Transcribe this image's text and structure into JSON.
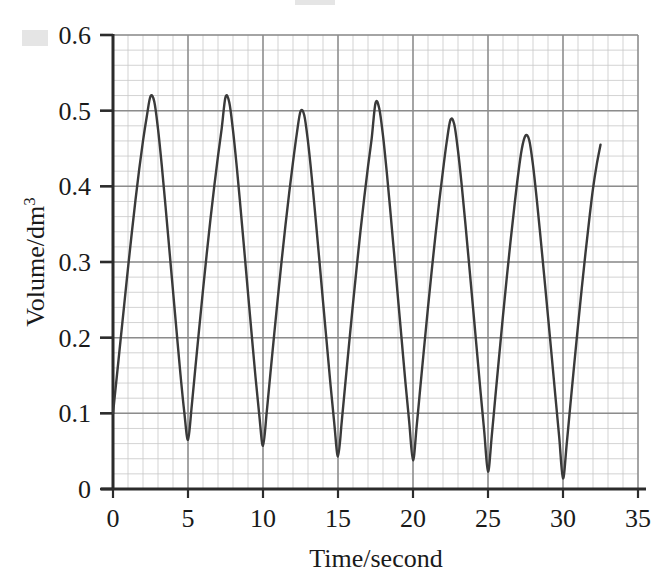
{
  "chart_data": {
    "type": "line",
    "title": "",
    "subtitle": "",
    "xlabel": "Time/second",
    "ylabel": "Volume/dm3",
    "ylabel_base": "Volume/dm",
    "ylabel_exponent": "3",
    "xlim": [
      0,
      35
    ],
    "ylim": [
      0,
      0.6
    ],
    "x_ticks": [
      0,
      5,
      10,
      15,
      20,
      25,
      30,
      35
    ],
    "x_tick_labels": [
      "0",
      "5",
      "10",
      "15",
      "20",
      "25",
      "30",
      "35"
    ],
    "y_ticks": [
      0,
      0.1,
      0.2,
      0.3,
      0.4,
      0.5,
      0.6
    ],
    "y_tick_labels": [
      "0",
      "0.1",
      "0.2",
      "0.3",
      "0.4",
      "0.5",
      "0.6"
    ],
    "x_minor_step": 1,
    "y_minor_step": 0.02,
    "grid": true,
    "grid_major_color": "#8c8c8c",
    "grid_minor_color": "#c8c8c8",
    "legend": null,
    "legend_position": "none",
    "series": [
      {
        "name": "Volume",
        "color": "#3a3a3a",
        "line_width": 2.4,
        "x": [
          0.0,
          0.25,
          0.5,
          0.75,
          1.0,
          1.25,
          1.5,
          1.75,
          2.0,
          2.25,
          2.5,
          2.75,
          3.0,
          3.25,
          3.5,
          3.75,
          4.0,
          4.25,
          4.5,
          4.75,
          5.0,
          5.25,
          5.5,
          5.75,
          6.0,
          6.25,
          6.5,
          6.75,
          7.0,
          7.25,
          7.5,
          7.75,
          8.0,
          8.25,
          8.5,
          8.75,
          9.0,
          9.25,
          9.5,
          9.75,
          10.0,
          10.25,
          10.5,
          10.75,
          11.0,
          11.25,
          11.5,
          11.75,
          12.0,
          12.25,
          12.5,
          12.75,
          13.0,
          13.25,
          13.5,
          13.75,
          14.0,
          14.25,
          14.5,
          14.75,
          15.0,
          15.25,
          15.5,
          15.75,
          16.0,
          16.25,
          16.5,
          16.75,
          17.0,
          17.25,
          17.5,
          17.75,
          18.0,
          18.25,
          18.5,
          18.75,
          19.0,
          19.25,
          19.5,
          19.75,
          20.0,
          20.25,
          20.5,
          20.75,
          21.0,
          21.25,
          21.5,
          21.75,
          22.0,
          22.25,
          22.5,
          22.75,
          23.0,
          23.25,
          23.5,
          23.75,
          24.0,
          24.25,
          24.5,
          24.75,
          25.0,
          25.25,
          25.5,
          25.75,
          26.0,
          26.25,
          26.5,
          26.75,
          27.0,
          27.25,
          27.5,
          27.75,
          28.0,
          28.25,
          28.5,
          28.75,
          29.0,
          29.25,
          29.5,
          29.75,
          30.0,
          30.25,
          30.5,
          30.75,
          31.0,
          31.25,
          31.5,
          31.75,
          32.0,
          32.25,
          32.5
        ],
        "y": [
          0.1,
          0.148,
          0.196,
          0.244,
          0.292,
          0.338,
          0.382,
          0.423,
          0.46,
          0.492,
          0.519,
          0.512,
          0.476,
          0.428,
          0.374,
          0.318,
          0.262,
          0.206,
          0.151,
          0.102,
          0.065,
          0.11,
          0.162,
          0.213,
          0.263,
          0.311,
          0.357,
          0.4,
          0.44,
          0.477,
          0.518,
          0.511,
          0.474,
          0.426,
          0.372,
          0.316,
          0.259,
          0.203,
          0.148,
          0.098,
          0.057,
          0.102,
          0.154,
          0.205,
          0.255,
          0.303,
          0.349,
          0.392,
          0.432,
          0.469,
          0.499,
          0.494,
          0.459,
          0.412,
          0.359,
          0.304,
          0.248,
          0.193,
          0.138,
          0.087,
          0.043,
          0.089,
          0.142,
          0.194,
          0.245,
          0.294,
          0.341,
          0.385,
          0.426,
          0.464,
          0.51,
          0.503,
          0.467,
          0.419,
          0.365,
          0.309,
          0.252,
          0.196,
          0.14,
          0.088,
          0.038,
          0.084,
          0.137,
          0.189,
          0.24,
          0.289,
          0.336,
          0.38,
          0.421,
          0.459,
          0.488,
          0.482,
          0.447,
          0.401,
          0.349,
          0.295,
          0.24,
          0.185,
          0.129,
          0.076,
          0.023,
          0.07,
          0.124,
          0.177,
          0.229,
          0.279,
          0.327,
          0.372,
          0.414,
          0.449,
          0.467,
          0.461,
          0.428,
          0.383,
          0.333,
          0.281,
          0.228,
          0.175,
          0.121,
          0.068,
          0.014,
          0.06,
          0.113,
          0.165,
          0.216,
          0.265,
          0.312,
          0.356,
          0.397,
          0.429,
          0.455
        ]
      }
    ],
    "peaks": [
      {
        "x": 2.5,
        "y": 0.52
      },
      {
        "x": 7.5,
        "y": 0.52
      },
      {
        "x": 12.5,
        "y": 0.5
      },
      {
        "x": 17.5,
        "y": 0.51
      },
      {
        "x": 22.5,
        "y": 0.488
      },
      {
        "x": 27.5,
        "y": 0.467
      }
    ],
    "troughs": [
      {
        "x": 5,
        "y": 0.065
      },
      {
        "x": 10,
        "y": 0.057
      },
      {
        "x": 15,
        "y": 0.043
      },
      {
        "x": 20,
        "y": 0.038
      },
      {
        "x": 25,
        "y": 0.023
      },
      {
        "x": 30,
        "y": 0.014
      }
    ],
    "start_point": {
      "x": 0,
      "y": 0.1
    },
    "end_point": {
      "x": 32.5,
      "y": 0.455
    }
  }
}
